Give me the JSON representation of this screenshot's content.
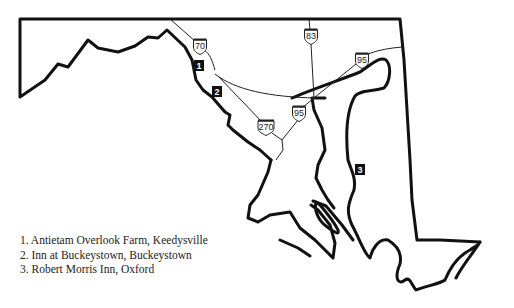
{
  "map": {
    "region": "Maryland",
    "highways": [
      {
        "id": "I-70",
        "label": "70",
        "x": 200,
        "y": 46
      },
      {
        "id": "I-83",
        "label": "83",
        "x": 311,
        "y": 36
      },
      {
        "id": "I-95-north",
        "label": "95",
        "x": 362,
        "y": 60
      },
      {
        "id": "I-95-south",
        "label": "95",
        "x": 299,
        "y": 113
      },
      {
        "id": "I-270",
        "label": "270",
        "x": 266,
        "y": 127
      }
    ],
    "markers": [
      {
        "number": "1",
        "x": 199,
        "y": 66
      },
      {
        "number": "2",
        "x": 217,
        "y": 92
      },
      {
        "number": "3",
        "x": 360,
        "y": 170
      }
    ]
  },
  "legend": {
    "items": [
      {
        "label": "1. Antietam Overlook Farm, Keedysville"
      },
      {
        "label": "2. Inn at Buckeystown, Buckeystown"
      },
      {
        "label": "3. Robert Morris Inn, Oxford"
      }
    ]
  }
}
